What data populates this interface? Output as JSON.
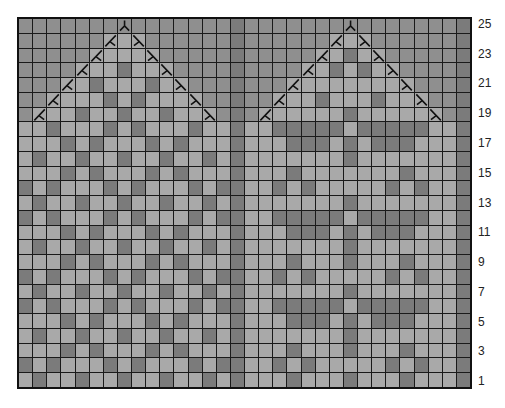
{
  "chart": {
    "title": "",
    "type": "knitting-chart",
    "columns": 32,
    "rows": 25,
    "row_labels": [
      "25",
      "23",
      "21",
      "19",
      "17",
      "15",
      "13",
      "11",
      "9",
      "7",
      "5",
      "3",
      "1"
    ],
    "colors": {
      "L": "#a9a9a9",
      "D": "#7b7b7b",
      "B": "#8f8f8f",
      "/": "#a9a9a9",
      "\\": "#a9a9a9",
      "^": "#8f8f8f"
    },
    "legend": {
      "L": "knit stitch (light)",
      "D": "contrast stitch (dark)",
      "B": "no stitch (shaded)",
      "/": "left decrease symbol",
      "\\": "right decrease symbol",
      "^": "double decrease symbol"
    },
    "grid_top_to_bottom": [
      "BBBBBBB^BBBBBBBDBBBBBBB^BBBBBBBD",
      "BBBBBB/L\\BBBBBBDBBBBBB/L\\BBBBBBD",
      "BBBBB/LLL\\BBBBBDBBBBB/LDL\\BBBBBD",
      "BBBB/LLDLL\\BBBBDBBBB/LDLDL\\BBBBD",
      "BBB/LDLLLDL\\BBBDBBB/LLLLLLL\\BBBD",
      "BB/LLLDLDLLL\\BBDBB/LLDLLLDLL\\BBD",
      "B/LLDLLDLLDLL\\BDB/LLLLLDLLLLL\\BD",
      "LLDLLLDLDLLLDLLDLLDDDDDLDDDDDLLD",
      "LLLDLDLLLDLDLLLDLLLDDDLDLDDDLLLD",
      "LDLLDLLDLLDLLDLDLLLLLLLDLLLLLLLD",
      "LLLDLDLLLDLDLLLDLLLDLLLLLLLDLLLD",
      "DLDLLLDLDLLLDLDDLLDLDLLLLLDLDLLD",
      "LDLLDLLDLLDLLDLDLLLLLLLDLLLLLLLD",
      "DLDLLLDLDLLLDLDDLLDDDDDLDDDDDLLD",
      "LLLDLDLLLDLDLLLDLLLDDDLDLDDDLLLD",
      "LDLLDLLDLLDLLDLDLLLLLLLDLLLLLLLD",
      "LLLDLDLLLDLDLLLDLLLDLLLDLLLDLLLD",
      "DLDLLLDLDLLLDLDDLLDLDLLLLLDLDLLD",
      "LDLLDLLDLLDLLDLDLLLLLLLDLLLLLLLD",
      "DLDLLLDLDLLLDLDDLLDDDDDLDDDDDLLD",
      "LLLDLDLLLDLDLLLDLLLDDDLDLDDDLLLD",
      "LDLLDLLDLLDLLDLDLLLLLLLDLLLLLLLD",
      "LLLDLDLLLDLDLLLDLLLDLLLDLLLDLLLD",
      "DLDLLLDLDLLLDLDDLLDLDLLLLLDLDLLD",
      "LDLLDLLDLLDLLDLDLLLDLLLDLLLDLLLD"
    ]
  }
}
